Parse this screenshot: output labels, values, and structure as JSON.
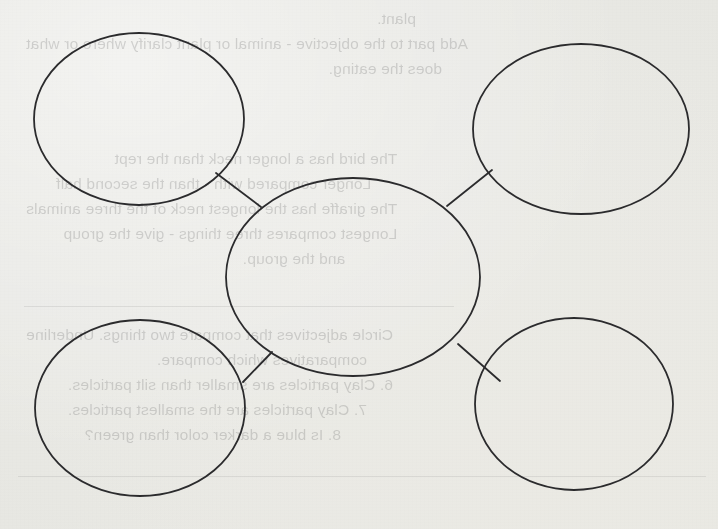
{
  "document": {
    "kind": "scanned-worksheet",
    "title": "Bubble Map Graphic Organizer",
    "paper_color": "#f4f4f2",
    "ink_color": "#2b2b2d"
  },
  "diagram": {
    "type": "bubble-map",
    "node_count": 5,
    "stroke_color": "#2b2b2d",
    "stroke_width": 1.8,
    "fill": "none",
    "nodes": [
      {
        "id": "center",
        "label": "",
        "cx": 353,
        "cy": 277,
        "rx": 127,
        "ry": 99
      },
      {
        "id": "top-left",
        "label": "",
        "cx": 139,
        "cy": 119,
        "rx": 105,
        "ry": 86
      },
      {
        "id": "top-right",
        "label": "",
        "cx": 581,
        "cy": 129,
        "rx": 108,
        "ry": 85
      },
      {
        "id": "bottom-left",
        "label": "",
        "cx": 140,
        "cy": 408,
        "rx": 105,
        "ry": 88
      },
      {
        "id": "bottom-right",
        "label": "",
        "cx": 574,
        "cy": 404,
        "rx": 99,
        "ry": 86
      }
    ],
    "connectors": [
      {
        "from": "top-left",
        "to": "center",
        "x1": 216,
        "y1": 173,
        "x2": 261,
        "y2": 207
      },
      {
        "from": "top-right",
        "to": "center",
        "x1": 492,
        "y1": 170,
        "x2": 447,
        "y2": 206
      },
      {
        "from": "bottom-left",
        "to": "center",
        "x1": 243,
        "y1": 382,
        "x2": 272,
        "y2": 352
      },
      {
        "from": "bottom-right",
        "to": "center",
        "x1": 500,
        "y1": 381,
        "x2": 458,
        "y2": 344
      }
    ]
  },
  "bleed_through": {
    "description": "faint mirrored text showing through from the reverse side of the sheet",
    "opacity": 0.185,
    "blocks": [
      {
        "id": "bleed-top",
        "top": 6,
        "right": 26,
        "lines": [
          "plant.",
          "Add part to the objective - animal or plant clarify where or what",
          "does the eating."
        ]
      },
      {
        "id": "bleed-middle",
        "top": 146,
        "right": 26,
        "lines": [
          "The bird has a longer neck than the rept",
          "Longer compared with - than the second half",
          "The giraffe has the longest neck of the three animals",
          "Longest compares three things - give the group",
          "and the group."
        ]
      },
      {
        "id": "bleed-bottom",
        "top": 322,
        "right": 26,
        "lines": [
          "Circle adjectives that compare two things. Underline",
          "comparatives which compare.",
          "6. Clay particles are smaller than silt particles.",
          "7. Clay particles are the smallest particles.",
          "8. Is blue a darker color than green?"
        ]
      }
    ],
    "rules": [
      {
        "top": 306,
        "left": 264,
        "width": 430
      },
      {
        "top": 476,
        "left": 12,
        "width": 688
      }
    ]
  }
}
